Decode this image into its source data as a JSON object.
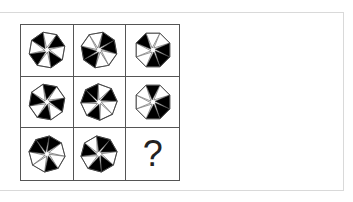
{
  "puzzle": {
    "type": "3x3 figure reasoning matrix",
    "shape": "octagon with 8 triangular segments",
    "colors": {
      "fill": "#000000",
      "empty": "#ffffff",
      "stroke": "#444444",
      "grid_line": "#555555",
      "panel_border": "#d9d9d9"
    },
    "cells": [
      {
        "row": 1,
        "col": 1,
        "segments": [
          1,
          0,
          1,
          0,
          1,
          0,
          1,
          0
        ],
        "rotation": 10
      },
      {
        "row": 1,
        "col": 2,
        "segments": [
          0,
          1,
          1,
          0,
          0,
          1,
          1,
          0
        ],
        "rotation": 35
      },
      {
        "row": 1,
        "col": 3,
        "segments": [
          1,
          1,
          0,
          0,
          1,
          0,
          0,
          1
        ],
        "rotation": 0
      },
      {
        "row": 2,
        "col": 1,
        "segments": [
          1,
          0,
          1,
          0,
          1,
          0,
          1,
          0
        ],
        "rotation": 55
      },
      {
        "row": 2,
        "col": 2,
        "segments": [
          0,
          1,
          0,
          1,
          1,
          0,
          1,
          0
        ],
        "rotation": 20
      },
      {
        "row": 2,
        "col": 3,
        "segments": [
          1,
          1,
          0,
          0,
          0,
          1,
          0,
          1
        ],
        "rotation": 0
      },
      {
        "row": 3,
        "col": 1,
        "segments": [
          1,
          0,
          0,
          1,
          1,
          1,
          0,
          0
        ],
        "rotation": 30
      },
      {
        "row": 3,
        "col": 2,
        "segments": [
          1,
          1,
          0,
          1,
          0,
          1,
          1,
          0
        ],
        "rotation": 15
      }
    ],
    "unknown_cell": {
      "row": 3,
      "col": 3,
      "label": "?"
    }
  }
}
